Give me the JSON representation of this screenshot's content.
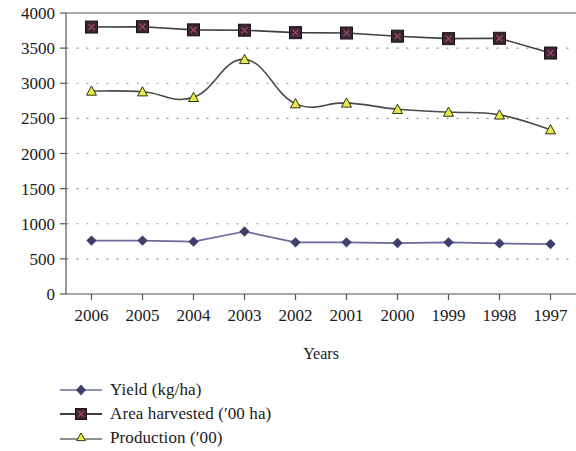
{
  "chart_data": {
    "type": "line",
    "title": "",
    "xlabel": "Years",
    "ylabel": "",
    "categories": [
      "2006",
      "2005",
      "2004",
      "2003",
      "2002",
      "2001",
      "2000",
      "1999",
      "1998",
      "1997"
    ],
    "ylim": [
      0,
      4000
    ],
    "ytick_step": 500,
    "yticks": [
      "4000",
      "3500",
      "3000",
      "2500",
      "2000",
      "1500",
      "1000",
      "500",
      "0"
    ],
    "grid": "horizontal-dotted",
    "legend_position": "below-left",
    "series": [
      {
        "name": "Yield (kg/ha)",
        "marker": "diamond",
        "color": "#4a4a7a",
        "line_color": "#6b6b9c",
        "smooth": false,
        "values": [
          760,
          760,
          745,
          890,
          735,
          735,
          725,
          735,
          720,
          710
        ]
      },
      {
        "name": "Area harvested ('00 ha)",
        "marker": "square-x",
        "color": "#3a2636",
        "line_color": "#3f3f3f",
        "smooth": false,
        "values": [
          3800,
          3805,
          3760,
          3755,
          3720,
          3715,
          3670,
          3635,
          3640,
          3430
        ]
      },
      {
        "name": "Production ('00)",
        "marker": "triangle",
        "color": "#e8e84a",
        "line_color": "#4a4a4a",
        "smooth": true,
        "values": [
          2890,
          2880,
          2800,
          3340,
          2710,
          2720,
          2630,
          2590,
          2550,
          2340
        ]
      }
    ]
  },
  "legend": {
    "items": [
      {
        "label": "Yield (kg/ha)"
      },
      {
        "label": "Area harvested (′00 ha)"
      },
      {
        "label": "Production (′00)"
      }
    ]
  },
  "axis": {
    "x_title": "Years"
  }
}
